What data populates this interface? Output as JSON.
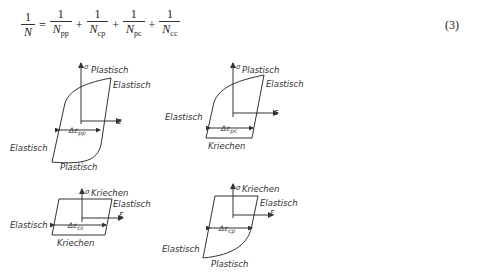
{
  "equation": {
    "lhs": {
      "num": "1",
      "den": "N"
    },
    "equals": "=",
    "terms": [
      {
        "num": "1",
        "den": "N",
        "sub": "pp"
      },
      {
        "num": "1",
        "den": "N",
        "sub": "cp"
      },
      {
        "num": "1",
        "den": "N",
        "sub": "pc"
      },
      {
        "num": "1",
        "den": "N",
        "sub": "cc"
      }
    ],
    "plus": "+",
    "number": "(3)"
  },
  "diagrams": [
    {
      "id": "pp",
      "sigma": "σ",
      "epsilon": "ε",
      "labels": {
        "top": "Plastisch",
        "right": "Elastisch",
        "left": "Elastisch",
        "bottom": "Plastisch"
      },
      "range_label": "Δε",
      "range_sub": "pp"
    },
    {
      "id": "pc",
      "sigma": "σ",
      "epsilon": "ε",
      "labels": {
        "top": "Plastisch",
        "right": "Elastisch",
        "left": "Elastisch",
        "bottom": "Kriechen"
      },
      "range_label": "Δε",
      "range_sub": "pc"
    },
    {
      "id": "cc",
      "sigma": "σ",
      "epsilon": "ε",
      "labels": {
        "top": "Kriechen",
        "right": "Elastisch",
        "left": "Elastisch",
        "bottom": "Kriechen"
      },
      "range_label": "Δε",
      "range_sub": "cc"
    },
    {
      "id": "cp",
      "sigma": "σ",
      "epsilon": "ε",
      "labels": {
        "top": "Kriechen",
        "right": "Elastisch",
        "left": "Elastisch",
        "bottom": "Plastisch"
      },
      "range_label": "Δε",
      "range_sub": "cp"
    }
  ]
}
